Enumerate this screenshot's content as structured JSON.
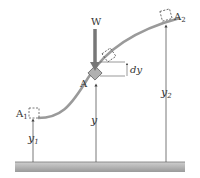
{
  "diagram": {
    "force_label": "W",
    "point_label": "A",
    "start_label": "A",
    "start_sub": "1",
    "end_label": "A",
    "end_sub": "2",
    "dy_label": "dy",
    "y_label": "y",
    "y1_label": "y",
    "y1_sub": "1",
    "y2_label": "y",
    "y2_sub": "2",
    "colors": {
      "curve": "#9a9a9a",
      "arrow": "#777777",
      "block": "#b0b0b0",
      "ground": "#a8a8a8",
      "lines": "#555555"
    }
  }
}
